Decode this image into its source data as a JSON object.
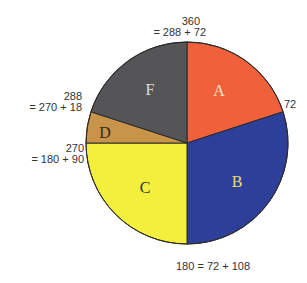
{
  "chart_data": {
    "type": "pie",
    "title": "",
    "units": "degrees",
    "start_angle": 0,
    "direction": "clockwise",
    "slices": [
      {
        "label": "A",
        "start": 0,
        "end": 72,
        "value": 72,
        "color": "#f0603a",
        "text_color": "#f5e6c8"
      },
      {
        "label": "B",
        "start": 72,
        "end": 180,
        "value": 108,
        "color": "#2e3f9a",
        "text_color": "#e8e060"
      },
      {
        "label": "C",
        "start": 180,
        "end": 270,
        "value": 90,
        "color": "#f4ef3c",
        "text_color": "#333333"
      },
      {
        "label": "D",
        "start": 270,
        "end": 288,
        "value": 18,
        "color": "#c8944a",
        "text_color": "#3a2a10"
      },
      {
        "label": "F",
        "start": 288,
        "end": 360,
        "value": 72,
        "color": "#555558",
        "text_color": "#dddddd"
      }
    ],
    "annotations": [
      {
        "id": "a360",
        "lines": [
          "360",
          "= 288 + 72"
        ]
      },
      {
        "id": "a72",
        "lines": [
          "72"
        ]
      },
      {
        "id": "a180",
        "lines": [
          "180 = 72 + 108"
        ]
      },
      {
        "id": "a270",
        "lines": [
          "270",
          "= 180 + 90"
        ]
      },
      {
        "id": "a288",
        "lines": [
          "288",
          "= 270 + 18"
        ]
      }
    ]
  }
}
